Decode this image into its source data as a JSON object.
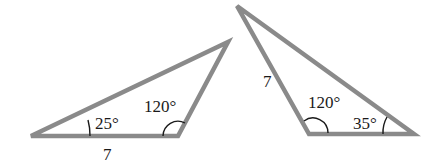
{
  "diagram": {
    "stroke_color": "#8a8a8a",
    "arc_color": "#1a1a1a",
    "triangles": [
      {
        "id": "left-triangle",
        "vertices": [
          [
            31,
            136
          ],
          [
            178,
            136
          ],
          [
            228,
            42
          ]
        ],
        "side_label": "7",
        "angles": [
          {
            "label": "25°",
            "vertex": "bottom-left"
          },
          {
            "label": "120°",
            "vertex": "bottom-right"
          }
        ]
      },
      {
        "id": "right-triangle",
        "vertices": [
          [
            237,
            6
          ],
          [
            309,
            134
          ],
          [
            414,
            134
          ]
        ],
        "side_label": "7",
        "angles": [
          {
            "label": "120°",
            "vertex": "bottom-left"
          },
          {
            "label": "35°",
            "vertex": "bottom-right"
          }
        ]
      }
    ]
  }
}
